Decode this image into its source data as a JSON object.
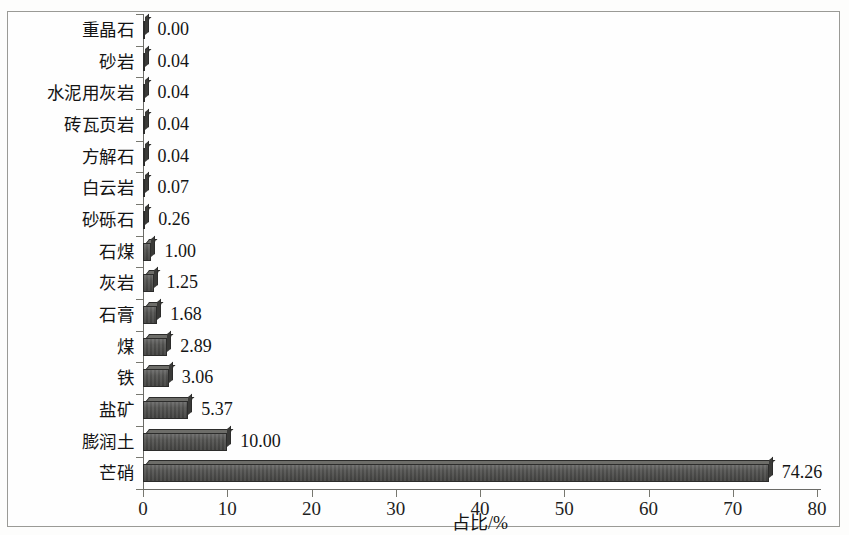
{
  "chart_data": {
    "type": "bar",
    "orientation": "horizontal",
    "title": "",
    "xlabel": "占比/%",
    "ylabel": "",
    "xlim": [
      0,
      80
    ],
    "xticks": [
      0,
      10,
      20,
      30,
      40,
      50,
      60,
      70,
      80
    ],
    "xtick_labels": [
      "0",
      "10",
      "20",
      "30",
      "40",
      "50",
      "60",
      "70",
      "80"
    ],
    "grid": false,
    "legend": null,
    "bar_style": "3d-shaded-dark-gray",
    "bar_color": "#4a4a48",
    "categories": [
      "重晶石",
      "砂岩",
      "水泥用灰岩",
      "砖瓦页岩",
      "方解石",
      "白云岩",
      "砂砾石",
      "石煤",
      "灰岩",
      "石膏",
      "煤",
      "铁",
      "盐矿",
      "膨润土",
      "芒硝"
    ],
    "values": [
      0.0,
      0.04,
      0.04,
      0.04,
      0.04,
      0.07,
      0.26,
      1.0,
      1.25,
      1.68,
      2.89,
      3.06,
      5.37,
      10.0,
      74.26
    ],
    "value_labels": [
      "0.00",
      "0.04",
      "0.04",
      "0.04",
      "0.04",
      "0.07",
      "0.26",
      "1.00",
      "1.25",
      "1.68",
      "2.89",
      "3.06",
      "5.37",
      "10.00",
      "74.26"
    ]
  }
}
